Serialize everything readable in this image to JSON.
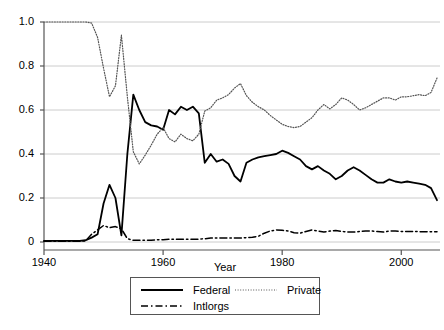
{
  "chart_data": {
    "type": "line",
    "title": "",
    "xlabel": "Year",
    "ylabel": "",
    "xlim": [
      1940,
      2006
    ],
    "ylim": [
      0,
      1.0
    ],
    "grid": true,
    "legend_position": "bottom",
    "xticks": [
      "1940",
      "1960",
      "1980",
      "2000"
    ],
    "xtick_values": [
      1940,
      1960,
      1980,
      2000
    ],
    "yticks": [
      "0",
      "0.2",
      "0.4",
      "0.6",
      "0.8",
      "1.0"
    ],
    "ytick_values": [
      0,
      0.2,
      0.4,
      0.6,
      0.8,
      1.0
    ],
    "x": [
      1940,
      1941,
      1942,
      1943,
      1944,
      1945,
      1946,
      1947,
      1948,
      1949,
      1950,
      1951,
      1952,
      1953,
      1954,
      1955,
      1956,
      1957,
      1958,
      1959,
      1960,
      1961,
      1962,
      1963,
      1964,
      1965,
      1966,
      1967,
      1968,
      1969,
      1970,
      1971,
      1972,
      1973,
      1974,
      1975,
      1976,
      1977,
      1978,
      1979,
      1980,
      1981,
      1982,
      1983,
      1984,
      1985,
      1986,
      1987,
      1988,
      1989,
      1990,
      1991,
      1992,
      1993,
      1994,
      1995,
      1996,
      1997,
      1998,
      1999,
      2000,
      2001,
      2002,
      2003,
      2004,
      2005,
      2006
    ],
    "series": [
      {
        "name": "Federal",
        "style": "solid",
        "color": "#000000",
        "values": [
          0.005,
          0.005,
          0.005,
          0.005,
          0.005,
          0.005,
          0.005,
          0.008,
          0.02,
          0.035,
          0.175,
          0.26,
          0.2,
          0.03,
          0.4,
          0.67,
          0.6,
          0.545,
          0.53,
          0.525,
          0.51,
          0.6,
          0.58,
          0.615,
          0.6,
          0.615,
          0.585,
          0.36,
          0.4,
          0.365,
          0.375,
          0.355,
          0.3,
          0.275,
          0.36,
          0.375,
          0.385,
          0.39,
          0.395,
          0.4,
          0.415,
          0.405,
          0.39,
          0.375,
          0.345,
          0.33,
          0.345,
          0.325,
          0.31,
          0.285,
          0.3,
          0.325,
          0.34,
          0.325,
          0.305,
          0.285,
          0.27,
          0.27,
          0.285,
          0.275,
          0.27,
          0.275,
          0.27,
          0.265,
          0.26,
          0.245,
          0.19
        ]
      },
      {
        "name": "Private",
        "style": "dotted",
        "color": "#555555",
        "values": [
          1.0,
          1.0,
          1.0,
          1.0,
          1.0,
          1.0,
          1.0,
          1.0,
          0.995,
          0.93,
          0.79,
          0.66,
          0.71,
          0.94,
          0.66,
          0.41,
          0.355,
          0.395,
          0.44,
          0.49,
          0.52,
          0.47,
          0.455,
          0.49,
          0.47,
          0.46,
          0.49,
          0.595,
          0.61,
          0.645,
          0.655,
          0.67,
          0.7,
          0.72,
          0.665,
          0.635,
          0.615,
          0.6,
          0.575,
          0.555,
          0.535,
          0.525,
          0.52,
          0.525,
          0.545,
          0.565,
          0.6,
          0.625,
          0.605,
          0.625,
          0.655,
          0.645,
          0.625,
          0.6,
          0.61,
          0.625,
          0.64,
          0.655,
          0.655,
          0.645,
          0.66,
          0.66,
          0.665,
          0.67,
          0.665,
          0.68,
          0.745
        ]
      },
      {
        "name": "Intlorgs",
        "style": "dashdot",
        "color": "#000000",
        "values": [
          0.003,
          0.003,
          0.003,
          0.003,
          0.003,
          0.003,
          0.003,
          0.005,
          0.035,
          0.055,
          0.075,
          0.065,
          0.07,
          0.06,
          0.015,
          0.008,
          0.008,
          0.008,
          0.008,
          0.01,
          0.01,
          0.012,
          0.013,
          0.012,
          0.012,
          0.012,
          0.013,
          0.015,
          0.018,
          0.018,
          0.018,
          0.018,
          0.018,
          0.018,
          0.02,
          0.022,
          0.026,
          0.04,
          0.05,
          0.055,
          0.053,
          0.05,
          0.042,
          0.04,
          0.048,
          0.055,
          0.05,
          0.045,
          0.05,
          0.052,
          0.048,
          0.045,
          0.045,
          0.048,
          0.05,
          0.05,
          0.048,
          0.045,
          0.05,
          0.05,
          0.048,
          0.048,
          0.048,
          0.047,
          0.047,
          0.047,
          0.047
        ]
      }
    ]
  },
  "legend": {
    "entries": [
      {
        "label": "Federal",
        "style": "solid"
      },
      {
        "label": "Private",
        "style": "dotted"
      },
      {
        "label": "Intlorgs",
        "style": "dashdot"
      }
    ]
  },
  "axis": {
    "x_title": "Year"
  }
}
